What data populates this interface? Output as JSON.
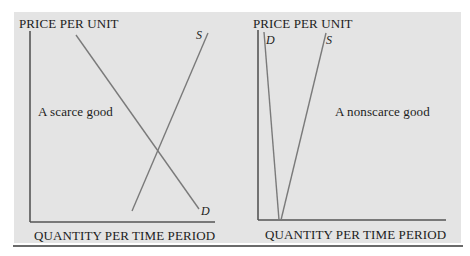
{
  "figure": {
    "left_chart": {
      "y_axis_label": "PRICE PER UNIT",
      "x_axis_label": "QUANTITY PER TIME PERIOD",
      "annotation": "A scarce good",
      "supply_label": "S",
      "demand_label": "D"
    },
    "right_chart": {
      "y_axis_label": "PRICE PER UNIT",
      "x_axis_label": "QUANTITY PER TIME PERIOD",
      "annotation": "A nonscarce good",
      "supply_label": "S",
      "demand_label": "D"
    },
    "colors": {
      "background_panel": "#e4e4e4",
      "axis": "#555555",
      "curve": "#7a7a7a",
      "text": "#1c1c1c"
    }
  }
}
